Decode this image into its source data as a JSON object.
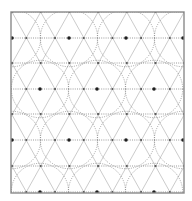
{
  "diagram": {
    "type": "triangular-lattice-with-circles",
    "frame": {
      "x": 11,
      "y": 12,
      "width": 173,
      "height": 181
    },
    "lattice": {
      "edge": 28.7,
      "row_spacing": 25.7,
      "rows_y": [
        12,
        38,
        63,
        89,
        114,
        140,
        166,
        192
      ],
      "even_row_x": [
        12,
        40.7,
        69.4,
        98.1,
        126.8,
        155.5,
        184.2
      ],
      "odd_row_x": [
        26.3,
        55,
        83.7,
        112.4,
        141.1,
        169.8
      ]
    },
    "major_nodes": [
      [
        69,
        38
      ],
      [
        126,
        38
      ],
      [
        40,
        89
      ],
      [
        97,
        89
      ],
      [
        154,
        89
      ],
      [
        12,
        38
      ],
      [
        183,
        38
      ],
      [
        69,
        140
      ],
      [
        126,
        140
      ],
      [
        12,
        140
      ],
      [
        183,
        140
      ],
      [
        40,
        192
      ],
      [
        97,
        192
      ],
      [
        154,
        192
      ]
    ],
    "colors": {
      "border": "#8a8a8a",
      "diagonal_lines": "#b4b4b4",
      "horizontal_lines": "#6e6e6e",
      "arcs": "#7a7a7a",
      "nodes": "#555555",
      "major_nodes": "#1e1e1e",
      "background": "#ffffff"
    }
  }
}
